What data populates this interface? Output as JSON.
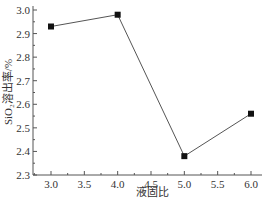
{
  "chart_data": {
    "type": "line",
    "title": "",
    "xlabel": "液固比",
    "ylabel": "SiO₂溶出率/%",
    "x": [
      3.0,
      4.0,
      5.0,
      6.0
    ],
    "series": [
      {
        "name": "SiO₂溶出率",
        "values": [
          2.93,
          2.98,
          2.38,
          2.56
        ],
        "marker": "square",
        "color": "#1a1a1a"
      }
    ],
    "xlim": [
      3.0,
      6.0
    ],
    "ylim": [
      2.3,
      3.0
    ],
    "xticks": [
      "3.0",
      "3.5",
      "4.0",
      "4.5",
      "5.0",
      "5.5",
      "6.0"
    ],
    "yticks": [
      "2.3",
      "2.4",
      "2.5",
      "2.6",
      "2.7",
      "2.8",
      "2.9",
      "3.0"
    ],
    "grid": false,
    "legend": false
  },
  "colors": {
    "axis": "#555555",
    "line": "#555555",
    "marker": "#111111",
    "text": "#333333"
  }
}
